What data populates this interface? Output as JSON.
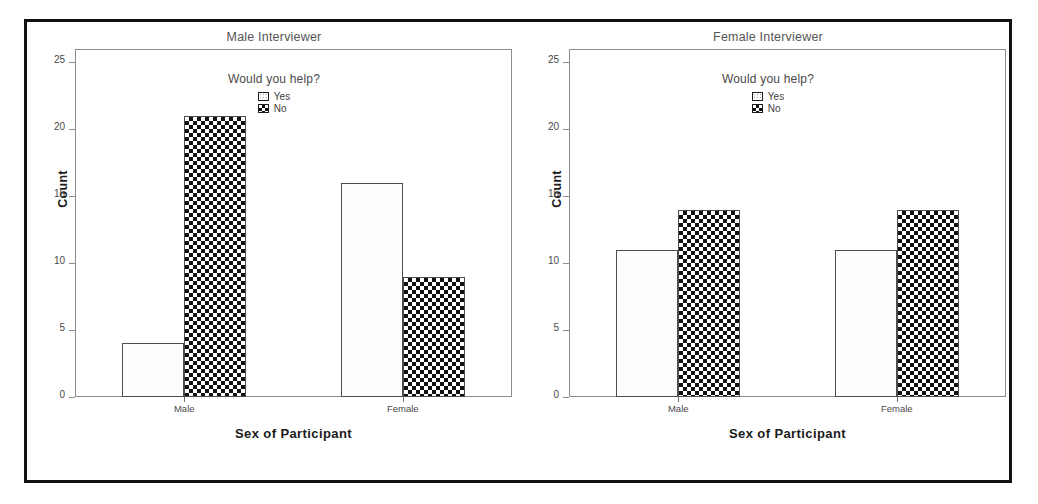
{
  "figure": {
    "panels": [
      {
        "title": "Male Interviewer",
        "legend_title": "Would you help?",
        "ylabel": "Count",
        "xlabel": "Sex of Participant"
      },
      {
        "title": "Female Interviewer",
        "legend_title": "Would you help?",
        "ylabel": "Count",
        "xlabel": "Sex of Participant"
      }
    ],
    "legend_entries": [
      {
        "label": "Yes",
        "pattern": "light-dotted-swatch"
      },
      {
        "label": "No",
        "pattern": "dark-checker-swatch"
      }
    ],
    "y_ticks": [
      "0",
      "5",
      "10",
      "15",
      "20",
      "25"
    ],
    "x_categories": [
      "Male",
      "Female"
    ]
  },
  "chart_data": [
    {
      "type": "bar",
      "title": "Male Interviewer",
      "xlabel": "Sex of Participant",
      "ylabel": "Count",
      "categories": [
        "Male",
        "Female"
      ],
      "series": [
        {
          "name": "Yes",
          "values": [
            4,
            16
          ]
        },
        {
          "name": "No",
          "values": [
            21,
            9
          ]
        }
      ],
      "ylim": [
        0,
        26
      ],
      "yticks": [
        0,
        5,
        10,
        15,
        20,
        25
      ],
      "legend_title": "Would you help?",
      "legend_position": "inside-top-center",
      "grid": false
    },
    {
      "type": "bar",
      "title": "Female Interviewer",
      "xlabel": "Sex of Participant",
      "ylabel": "Count",
      "categories": [
        "Male",
        "Female"
      ],
      "series": [
        {
          "name": "Yes",
          "values": [
            11,
            11
          ]
        },
        {
          "name": "No",
          "values": [
            14,
            14
          ]
        }
      ],
      "ylim": [
        0,
        26
      ],
      "yticks": [
        0,
        5,
        10,
        15,
        20,
        25
      ],
      "legend_title": "Would you help?",
      "legend_position": "inside-top-center",
      "grid": false
    }
  ]
}
